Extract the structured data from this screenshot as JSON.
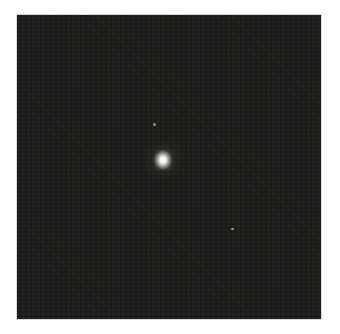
{
  "image": {
    "description": "Grayscale astronomical image of a single bright point source on a dark noisy background",
    "background_color": "#1c1a17",
    "border_color": "#ffffff",
    "sources": [
      {
        "name": "bright-point-source",
        "x": 163,
        "y": 160,
        "color": "#ffffff"
      },
      {
        "name": "faint-dot",
        "x": 154,
        "y": 124,
        "color": "#8a8a80"
      },
      {
        "name": "faint-dot",
        "x": 232,
        "y": 229,
        "color": "#a8a8a0"
      }
    ]
  }
}
